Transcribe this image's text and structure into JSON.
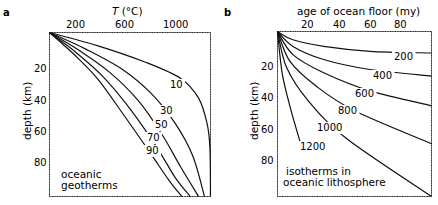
{
  "panels": {
    "a": {
      "letter": "a",
      "xlabel_italic": "T",
      "xlabel_rest": " (°C)",
      "xticks": [
        "200",
        "600",
        "1000"
      ],
      "ylabel": "depth (km)",
      "yticks": [
        "20",
        "40",
        "60",
        "80"
      ],
      "annotation_line1": "oceanic",
      "annotation_line2": "geotherms",
      "curve_labels": [
        "10",
        "30",
        "50",
        "70",
        "90"
      ]
    },
    "b": {
      "letter": "b",
      "xlabel": "age of ocean floor  (my)",
      "xticks": [
        "20",
        "40",
        "60",
        "80"
      ],
      "ylabel": "depth (km)",
      "yticks": [
        "20",
        "40",
        "60",
        "80"
      ],
      "annotation_line1": "isotherms in",
      "annotation_line2": "oceanic  lithosphere",
      "curve_labels": [
        "200",
        "400",
        "600",
        "800",
        "1000",
        "1200"
      ]
    }
  },
  "chart_data": [
    {
      "type": "line",
      "title": "oceanic geotherms",
      "xlabel": "T (°C)",
      "ylabel": "depth (km)",
      "x_axis_position": "top",
      "y_axis_inverted": true,
      "xlim": [
        0,
        1350
      ],
      "ylim": [
        0,
        100
      ],
      "xticks": [
        200,
        600,
        1000
      ],
      "yticks": [
        20,
        40,
        60,
        80
      ],
      "legend": "curves labeled by plate age (my)",
      "series": [
        {
          "name": "10",
          "points": [
            [
              0,
              0
            ],
            [
              400,
              8
            ],
            [
              800,
              18
            ],
            [
              1100,
              28
            ],
            [
              1250,
              40
            ],
            [
              1320,
              55
            ],
            [
              1345,
              70
            ],
            [
              1350,
              100
            ]
          ]
        },
        {
          "name": "30",
          "points": [
            [
              0,
              0
            ],
            [
              300,
              10
            ],
            [
              600,
              22
            ],
            [
              850,
              37
            ],
            [
              1050,
              55
            ],
            [
              1200,
              75
            ],
            [
              1300,
              100
            ]
          ]
        },
        {
          "name": "50",
          "points": [
            [
              0,
              0
            ],
            [
              250,
              11
            ],
            [
              500,
              24
            ],
            [
              750,
              42
            ],
            [
              950,
              63
            ],
            [
              1100,
              82
            ],
            [
              1250,
              100
            ]
          ]
        },
        {
          "name": "70",
          "points": [
            [
              0,
              0
            ],
            [
              220,
              12
            ],
            [
              450,
              27
            ],
            [
              680,
              47
            ],
            [
              900,
              70
            ],
            [
              1050,
              88
            ],
            [
              1180,
              100
            ]
          ]
        },
        {
          "name": "90",
          "points": [
            [
              0,
              0
            ],
            [
              200,
              13
            ],
            [
              400,
              28
            ],
            [
              620,
              50
            ],
            [
              850,
              74
            ],
            [
              1000,
              90
            ],
            [
              1110,
              100
            ]
          ]
        }
      ]
    },
    {
      "type": "line",
      "title": "isotherms in oceanic lithosphere",
      "xlabel": "age of ocean floor (my)",
      "ylabel": "depth (km)",
      "x_axis_position": "top",
      "y_axis_inverted": true,
      "xlim": [
        0,
        100
      ],
      "ylim": [
        0,
        100
      ],
      "xticks": [
        20,
        40,
        60,
        80
      ],
      "yticks": [
        20,
        40,
        60,
        80
      ],
      "legend": "curves labeled by temperature (°C)",
      "series": [
        {
          "name": "200",
          "points": [
            [
              0,
              0
            ],
            [
              10,
              5
            ],
            [
              30,
              9
            ],
            [
              60,
              12
            ],
            [
              100,
              13
            ]
          ]
        },
        {
          "name": "400",
          "points": [
            [
              0,
              0
            ],
            [
              10,
              9
            ],
            [
              30,
              17
            ],
            [
              60,
              23
            ],
            [
              100,
              27
            ]
          ]
        },
        {
          "name": "600",
          "points": [
            [
              0,
              0
            ],
            [
              10,
              14
            ],
            [
              30,
              25
            ],
            [
              60,
              36
            ],
            [
              100,
              45
            ]
          ]
        },
        {
          "name": "800",
          "points": [
            [
              0,
              0
            ],
            [
              8,
              18
            ],
            [
              25,
              33
            ],
            [
              50,
              48
            ],
            [
              100,
              68
            ]
          ]
        },
        {
          "name": "1000",
          "points": [
            [
              0,
              0
            ],
            [
              6,
              22
            ],
            [
              20,
              42
            ],
            [
              45,
              65
            ],
            [
              100,
              100
            ]
          ]
        },
        {
          "name": "1200",
          "points": [
            [
              0,
              0
            ],
            [
              3,
              25
            ],
            [
              8,
              45
            ],
            [
              15,
              68
            ]
          ]
        }
      ]
    }
  ]
}
